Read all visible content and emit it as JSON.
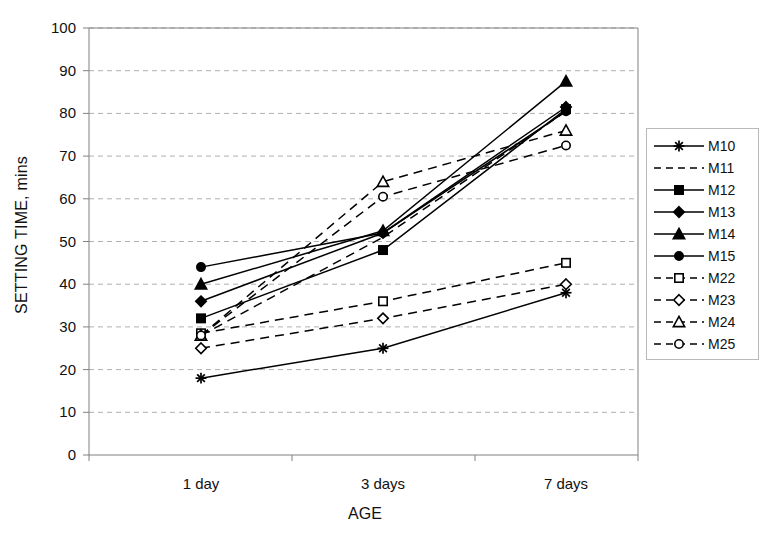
{
  "chart_data": {
    "type": "line",
    "title": "",
    "xlabel": "AGE",
    "ylabel": "SETTING TIME, mins",
    "categories": [
      "1 day",
      "3 days",
      "7 days"
    ],
    "ylim": [
      0,
      100
    ],
    "yticks": [
      0,
      10,
      20,
      30,
      40,
      50,
      60,
      70,
      80,
      90,
      100
    ],
    "grid": "horizontal-dashed",
    "legend_position": "right-outside",
    "series": [
      {
        "name": "M10",
        "values": [
          18,
          25,
          38
        ],
        "line": "solid",
        "marker": "star",
        "marker_fill": "filled"
      },
      {
        "name": "M11",
        "values": [
          28,
          51,
          80.5
        ],
        "line": "dashed",
        "marker": "none",
        "marker_fill": "none"
      },
      {
        "name": "M12",
        "values": [
          32,
          48,
          81
        ],
        "line": "solid",
        "marker": "square",
        "marker_fill": "filled"
      },
      {
        "name": "M13",
        "values": [
          36,
          52,
          81.5
        ],
        "line": "solid",
        "marker": "diamond",
        "marker_fill": "filled"
      },
      {
        "name": "M14",
        "values": [
          40,
          52.5,
          87.5
        ],
        "line": "solid",
        "marker": "triangle-up",
        "marker_fill": "filled"
      },
      {
        "name": "M15",
        "values": [
          44,
          52,
          80.5
        ],
        "line": "solid",
        "marker": "circle",
        "marker_fill": "filled"
      },
      {
        "name": "M22",
        "values": [
          28.5,
          36,
          45
        ],
        "line": "dashed",
        "marker": "square",
        "marker_fill": "open"
      },
      {
        "name": "M23",
        "values": [
          25,
          32,
          40
        ],
        "line": "dashed",
        "marker": "diamond",
        "marker_fill": "open"
      },
      {
        "name": "M24",
        "values": [
          28,
          64,
          76
        ],
        "line": "dashed",
        "marker": "triangle-up",
        "marker_fill": "open"
      },
      {
        "name": "M25",
        "values": [
          28,
          60.5,
          72.5
        ],
        "line": "dashed",
        "marker": "circle",
        "marker_fill": "open"
      }
    ],
    "colors": {
      "line": "#000000",
      "axis": "#808080",
      "grid": "#b0b0b0",
      "text": "#111111",
      "background": "#ffffff"
    }
  }
}
